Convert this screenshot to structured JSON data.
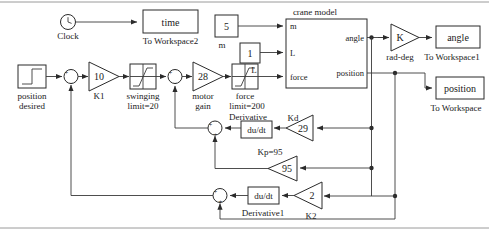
{
  "diagram": {
    "type": "simulink-block-diagram"
  },
  "blocks": {
    "clock": {
      "label": "Clock",
      "icon": "clock-icon"
    },
    "time_scope": {
      "value": "time",
      "caption": "To Workspace2"
    },
    "position_desired": {
      "caption_line1": "position",
      "caption_line2": "desired",
      "icon": "step-icon"
    },
    "sum1": {
      "sign_left": "+",
      "sign_bottom": "-"
    },
    "k1": {
      "value": "10",
      "caption": "K1"
    },
    "swinging": {
      "caption_line1": "swinging",
      "caption_line2": "limit=20",
      "icon": "saturation-icon"
    },
    "sum2": {
      "sign_left": "+",
      "sign_bottom": "-"
    },
    "motor_gain": {
      "value": "28",
      "caption_line1": "motor",
      "caption_line2": "gain"
    },
    "force_sat": {
      "caption_line1": "force",
      "caption_line2": "limit=200",
      "icon": "saturation-icon"
    },
    "const_m": {
      "value": "5",
      "caption": "m"
    },
    "const_l": {
      "value": "1",
      "caption": "L"
    },
    "crane_model": {
      "title": "crane model",
      "inputs": [
        "m",
        "L",
        "force"
      ],
      "outputs": [
        "angle",
        "position"
      ]
    },
    "rad_deg": {
      "value": "K",
      "caption": "rad-deg"
    },
    "angle_scope": {
      "value": "angle",
      "caption": "To Workspace1"
    },
    "position_scope": {
      "value": "position",
      "caption": "To Workspace"
    },
    "derivative": {
      "value": "du/dt",
      "caption": "Derivative"
    },
    "kd": {
      "value": "29",
      "caption": "Kd"
    },
    "kp": {
      "value": "95",
      "caption": "Kp=95"
    },
    "derivative1": {
      "value": "du/dt",
      "caption": "Derivative1"
    },
    "k2": {
      "value": "2",
      "caption": "K2"
    },
    "sum3": {
      "sign_left": "+",
      "sign_bottom": "+"
    },
    "sum4": {
      "sign_left": "+",
      "sign_bottom": "+"
    }
  },
  "colors": {
    "line": "#3a3a3a",
    "block_stroke": "#2b2b2b",
    "background": "#ffffff",
    "frame": "#9a9a9a"
  }
}
